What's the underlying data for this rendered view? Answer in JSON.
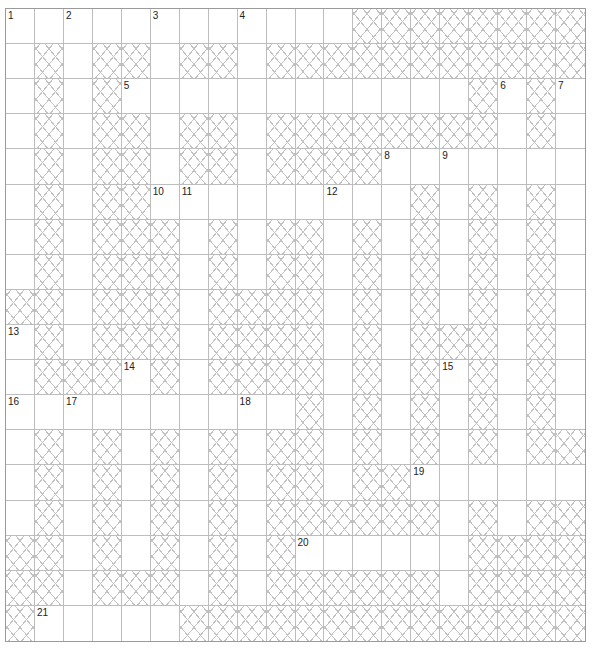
{
  "puzzle": {
    "rows": 18,
    "cols": 20,
    "colors": {
      "grid_line": "#bdbdbd",
      "border": "#9a9a9a",
      "block_hatch": "#c2c2c2",
      "cell_bg": "#ffffff",
      "number_text": "#222222"
    },
    "layout": [
      "............########",
      ".#.##.##.###########",
      ".#.#............#.#.",
      ".#.##.##.########.#.",
      ".#.##.##.####.......",
      ".#.##.........#.#.#.",
      ".#.###.#.##.#.#.#.#.",
      ".#.###.#.##.#.#.#.#.",
      "##.###.####.#.#.#.#.",
      ".#.###.####.#.###.#.",
      ".###.#.####.#.#.#.#.",
      "..........#.#.#.#.#.",
      ".#.#.#.#.##.#.#.#.##",
      ".#.#.#.#.##.##......",
      ".#.#.#.#.######.#.##",
      "##.#.#.#.#......####",
      "##.###.#.######.####",
      "#.....##############"
    ],
    "numbers": [
      {
        "n": "1",
        "r": 0,
        "c": 0
      },
      {
        "n": "2",
        "r": 0,
        "c": 2
      },
      {
        "n": "3",
        "r": 0,
        "c": 5
      },
      {
        "n": "4",
        "r": 0,
        "c": 8
      },
      {
        "n": "5",
        "r": 2,
        "c": 4
      },
      {
        "n": "6",
        "r": 2,
        "c": 17
      },
      {
        "n": "7",
        "r": 2,
        "c": 19
      },
      {
        "n": "8",
        "r": 4,
        "c": 13
      },
      {
        "n": "9",
        "r": 4,
        "c": 15
      },
      {
        "n": "10",
        "r": 5,
        "c": 5
      },
      {
        "n": "11",
        "r": 5,
        "c": 6
      },
      {
        "n": "12",
        "r": 5,
        "c": 11
      },
      {
        "n": "13",
        "r": 9,
        "c": 0
      },
      {
        "n": "14",
        "r": 10,
        "c": 4
      },
      {
        "n": "15",
        "r": 10,
        "c": 15
      },
      {
        "n": "16",
        "r": 11,
        "c": 0
      },
      {
        "n": "17",
        "r": 11,
        "c": 2
      },
      {
        "n": "18",
        "r": 11,
        "c": 8
      },
      {
        "n": "19",
        "r": 13,
        "c": 14
      },
      {
        "n": "20",
        "r": 15,
        "c": 10
      },
      {
        "n": "21",
        "r": 17,
        "c": 1
      }
    ]
  }
}
